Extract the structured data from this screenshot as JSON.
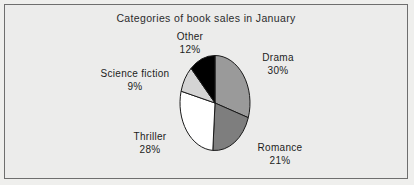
{
  "chart_data": {
    "type": "pie",
    "title": "Categories of book sales in January",
    "categories": [
      "Drama",
      "Romance",
      "Thriller",
      "Science fiction",
      "Other"
    ],
    "values": [
      30,
      21,
      28,
      9,
      12
    ],
    "value_suffix": "%",
    "start_angle_deg": 0,
    "direction": "clockwise",
    "legend": "none",
    "grid": false,
    "slice_colors": [
      "#9a9a9a",
      "#7e7e7e",
      "#ffffff",
      "#d4d4d4",
      "#000000"
    ],
    "slice_outline_color": "#1a1a1a",
    "labels": [
      {
        "name": "Drama",
        "pct": "30%"
      },
      {
        "name": "Romance",
        "pct": "21%"
      },
      {
        "name": "Thriller",
        "pct": "28%"
      },
      {
        "name": "Science fiction",
        "pct": "9%"
      },
      {
        "name": "Other",
        "pct": "12%"
      }
    ]
  },
  "panel": {
    "background_color": "#ececeb",
    "border_color": "#6e6e6e"
  }
}
